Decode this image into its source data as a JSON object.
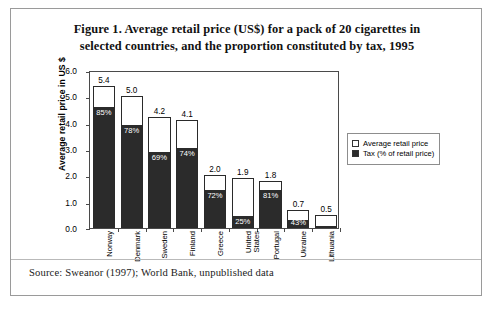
{
  "figure": {
    "title_line1": "Figure 1. Average retail price (US$) for a pack of 20 cigarettes in",
    "title_line2": "selected countries, and the proportion constituted by tax, 1995",
    "source": "Source: Sweanor (1997); World Bank, unpublished data"
  },
  "legend": {
    "items": [
      {
        "label": "Average retail price",
        "swatch": "hollow"
      },
      {
        "label": "Tax (% of retail price)",
        "swatch": "filled"
      }
    ]
  },
  "chart_data": {
    "type": "bar",
    "title": "Figure 1. Average retail price (US$) for a pack of 20 cigarettes in selected countries, and the proportion constituted by tax, 1995",
    "xlabel": "",
    "ylabel": "Average retail price in US $",
    "ylim": [
      0,
      6
    ],
    "yticks": [
      "0.0",
      "1.0",
      "2.0",
      "3.0",
      "4.0",
      "5.0",
      "6.0"
    ],
    "ytick_values": [
      0,
      1,
      2,
      3,
      4,
      5,
      6
    ],
    "grid": false,
    "legend_position": "right",
    "categories": [
      "Norway",
      "Denmark",
      "Sweden",
      "Finland",
      "Greece",
      "United\nStates",
      "Portugal",
      "Ukraine",
      "Lithuania"
    ],
    "series": [
      {
        "name": "Average retail price",
        "unit": "US$",
        "values": [
          5.4,
          5.0,
          4.2,
          4.1,
          2.0,
          1.9,
          1.8,
          0.7,
          0.5
        ]
      },
      {
        "name": "Tax (% of retail price)",
        "unit": "%",
        "values": [
          85,
          78,
          69,
          74,
          72,
          25,
          81,
          43,
          19
        ]
      }
    ],
    "value_labels": [
      "5.4",
      "5.0",
      "4.2",
      "4.1",
      "2.0",
      "1.9",
      "1.8",
      "0.7",
      "0.5"
    ],
    "tax_labels": [
      "85%",
      "78%",
      "69%",
      "74%",
      "72%",
      "25%",
      "81%",
      "43%",
      "19%"
    ]
  }
}
